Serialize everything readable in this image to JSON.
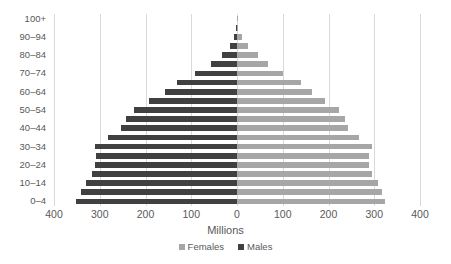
{
  "chart_data": {
    "type": "bar",
    "subtype": "population-pyramid",
    "title": "",
    "xlabel": "Millions",
    "ylabel": "",
    "xlim": [
      -400,
      400
    ],
    "x_ticks": [
      "400",
      "300",
      "200",
      "100",
      "0",
      "100",
      "200",
      "300",
      "400"
    ],
    "x_tick_values": [
      -400,
      -300,
      -200,
      -100,
      0,
      100,
      200,
      300,
      400
    ],
    "grid": true,
    "legend_position": "bottom",
    "categories": [
      "0–4",
      "5–9",
      "10–14",
      "15–19",
      "20–24",
      "25–29",
      "30–34",
      "35–39",
      "40–44",
      "45–49",
      "50–54",
      "55–59",
      "60–64",
      "65–69",
      "70–74",
      "75–79",
      "80–84",
      "85–89",
      "90–94",
      "95–99",
      "100+"
    ],
    "y_tick_labels": [
      "0–4",
      "10–14",
      "20–24",
      "30–34",
      "40–44",
      "50–54",
      "60–64",
      "70–74",
      "80–84",
      "90–94",
      "100+"
    ],
    "series": [
      {
        "name": "Males",
        "color": "#404040",
        "side": "left",
        "values": [
          352,
          341,
          330,
          318,
          310,
          308,
          310,
          282,
          253,
          243,
          225,
          192,
          158,
          131,
          92,
          57,
          32,
          16,
          6,
          1.5,
          0.3
        ]
      },
      {
        "name": "Females",
        "color": "#a6a6a6",
        "side": "right",
        "values": [
          323,
          318,
          308,
          296,
          288,
          288,
          294,
          267,
          242,
          236,
          222,
          193,
          164,
          139,
          100,
          67,
          45,
          25,
          11,
          3,
          0.6
        ]
      }
    ]
  },
  "legend": {
    "items": [
      {
        "label": "Females",
        "color": "#a6a6a6",
        "swatch": "females"
      },
      {
        "label": "Males",
        "color": "#404040",
        "swatch": "males"
      }
    ]
  },
  "axis": {
    "x_title": "Millions"
  }
}
